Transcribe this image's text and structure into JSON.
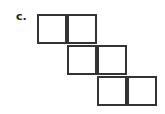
{
  "label": "c.",
  "stroke_color": "#333333",
  "cells": [
    {
      "row": 0,
      "col": 0
    },
    {
      "row": 0,
      "col": 1
    },
    {
      "row": 1,
      "col": 1
    },
    {
      "row": 1,
      "col": 2
    },
    {
      "row": 2,
      "col": 2
    },
    {
      "row": 2,
      "col": 3
    }
  ]
}
